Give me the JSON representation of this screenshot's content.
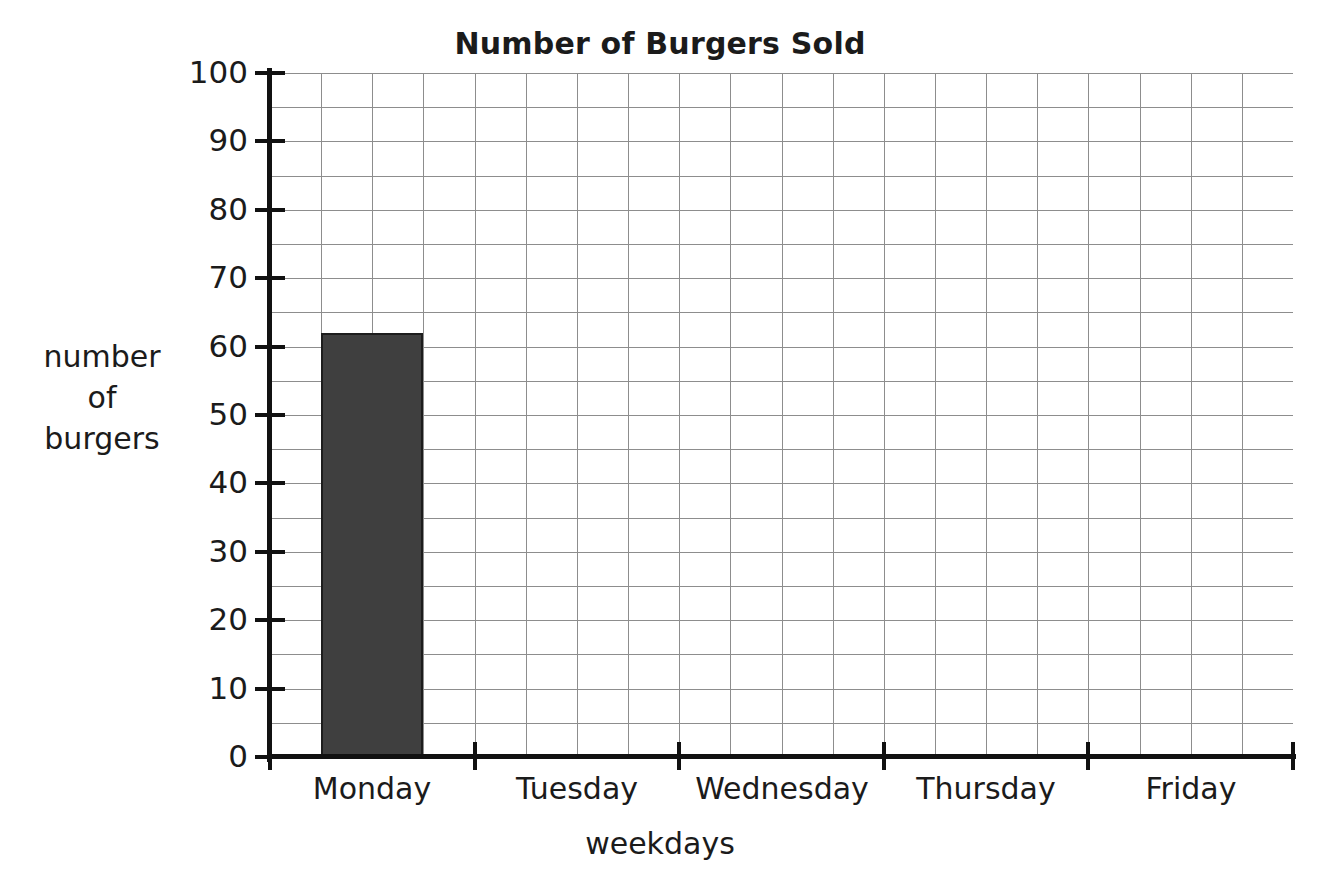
{
  "chart_data": {
    "type": "bar",
    "title": "Number of Burgers Sold",
    "xlabel": "weekdays",
    "ylabel": "number of burgers",
    "ylabel_lines": [
      "number",
      "of",
      "burgers"
    ],
    "categories": [
      "Monday",
      "Tuesday",
      "Wednesday",
      "Thursday",
      "Friday"
    ],
    "values": [
      62,
      0,
      0,
      0,
      0
    ],
    "ylim": [
      0,
      100
    ],
    "ytick_labels": [
      "0",
      "10",
      "20",
      "30",
      "40",
      "50",
      "60",
      "70",
      "80",
      "90",
      "100"
    ],
    "ytick_values": [
      0,
      10,
      20,
      30,
      40,
      50,
      60,
      70,
      80,
      90,
      100
    ],
    "ytick_step": 10,
    "minor_grid_step": 5,
    "grid": "on",
    "grid_columns": 20,
    "legend": "none",
    "bar_color": "#3f3f3f",
    "bar_edge_color": "#1d1d1d",
    "grid_color": "#8d8d8d",
    "axis_color": "#111111",
    "background_color": "#ffffff"
  }
}
